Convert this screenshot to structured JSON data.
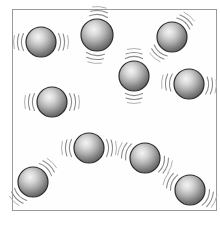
{
  "figure": {
    "caption": "",
    "kind": "particle-diagram"
  },
  "container": {
    "name": "particle-box",
    "border_color": "#9a9a9a",
    "fill_color": "#fefefe",
    "x": 12,
    "y": 9,
    "width": 205,
    "height": 202
  },
  "sphere_style": {
    "highlight_color": "#f2f2f2",
    "mid_color": "#a8a8a8",
    "edge_color": "#555555",
    "outline_color": "#2b2b2b",
    "arc_color": "#8c8c8c"
  },
  "particles": [
    {
      "id": "particle-1",
      "label": "1",
      "cx": 41,
      "cy": 42,
      "r": 15,
      "arc_angle": 0
    },
    {
      "id": "particle-2",
      "label": "2",
      "cx": 97,
      "cy": 35,
      "r": 16,
      "arc_angle": 95
    },
    {
      "id": "particle-3",
      "label": "3",
      "cx": 172,
      "cy": 37,
      "r": 15,
      "arc_angle": 130
    },
    {
      "id": "particle-4",
      "label": "4",
      "cx": 134,
      "cy": 76,
      "r": 15,
      "arc_angle": 90
    },
    {
      "id": "particle-5",
      "label": "5",
      "cx": 189,
      "cy": 84,
      "r": 15,
      "arc_angle": 5
    },
    {
      "id": "particle-6",
      "label": "6",
      "cx": 52,
      "cy": 102,
      "r": 15,
      "arc_angle": 0
    },
    {
      "id": "particle-7",
      "label": "7",
      "cx": 89,
      "cy": 148,
      "r": 15,
      "arc_angle": 0
    },
    {
      "id": "particle-8",
      "label": "8",
      "cx": 145,
      "cy": 158,
      "r": 15,
      "arc_angle": 20
    },
    {
      "id": "particle-9",
      "label": "9",
      "cx": 33,
      "cy": 182,
      "r": 15,
      "arc_angle": 135
    },
    {
      "id": "particle-10",
      "label": "10",
      "cx": 190,
      "cy": 190,
      "r": 15,
      "arc_angle": 25
    }
  ]
}
